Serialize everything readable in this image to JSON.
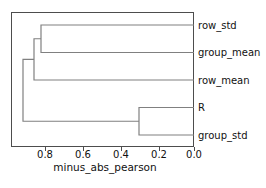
{
  "figure": {
    "type": "dendrogram",
    "background_color": "#ffffff",
    "line_color": "#808080",
    "axis_color": "#4d4d4d",
    "text_color": "#111111"
  },
  "axis": {
    "title": "minus_abs_pearson",
    "orientation": "horizontal-bottom",
    "direction": "reversed",
    "range": [
      0.9635,
      0.0
    ],
    "tick_values": [
      0.8,
      0.6,
      0.4,
      0.2,
      0.0
    ],
    "tick_labels": [
      "0.8",
      "0.6",
      "0.4",
      "0.2",
      "0.0"
    ]
  },
  "leaves": [
    {
      "label": "row_std",
      "order": 0
    },
    {
      "label": "group_mean",
      "order": 1
    },
    {
      "label": "row_mean",
      "order": 2
    },
    {
      "label": "R",
      "order": 3
    },
    {
      "label": "group_std",
      "order": 4
    }
  ],
  "chart_data": {
    "type": "dendrogram",
    "title": "",
    "xlabel": "minus_abs_pearson",
    "ylabel": "",
    "xlim": [
      0.9635,
      0.0
    ],
    "grid": false,
    "legend": false,
    "orientation": "right",
    "leaf_labels": [
      "row_std",
      "group_mean",
      "row_mean",
      "R",
      "group_std"
    ],
    "merges": [
      {
        "id": "m1",
        "children": [
          "row_std",
          "group_mean"
        ],
        "height": 0.805
      },
      {
        "id": "m2",
        "children": [
          "m1",
          "row_mean"
        ],
        "height": 0.842
      },
      {
        "id": "m3",
        "children": [
          "R",
          "group_std"
        ],
        "height": 0.289
      },
      {
        "id": "m4",
        "children": [
          "m2",
          "m3"
        ],
        "height": 0.9
      }
    ]
  },
  "geometry": {
    "plot_left_px": 11,
    "plot_right_px": 194,
    "plot_top_px": 12,
    "plot_bottom_px": 146,
    "leaf_y_px": [
      25,
      52.5,
      80,
      107.5,
      135
    ],
    "tick_x_px": [
      45.0,
      83.0,
      121.0,
      159.0,
      194.0
    ],
    "merge_x_px": {
      "m1": 41.0,
      "m2": 34.0,
      "m3": 139.0,
      "m4": 23.0
    },
    "label_x_px": 198,
    "axis_title_x_px": 105,
    "axis_title_y_px": 171,
    "tick_label_y_px": 158
  }
}
